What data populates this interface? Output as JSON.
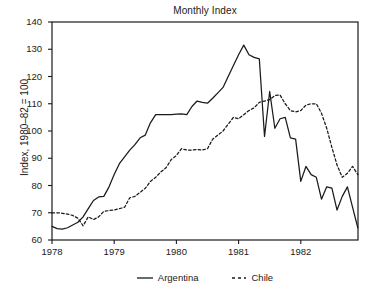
{
  "chart_data": {
    "type": "line",
    "title": "Monthly Index",
    "xlabel": "",
    "ylabel": "Index, 1980–82 = 100",
    "xlim": [
      1978.0,
      1982.92
    ],
    "ylim": [
      60,
      140
    ],
    "ytick_labels": [
      "140",
      "130",
      "120",
      "110",
      "100",
      "90",
      "80",
      "70",
      "60"
    ],
    "yticks": [
      140,
      130,
      120,
      110,
      100,
      90,
      80,
      70,
      60
    ],
    "xtick_labels": [
      "1978",
      "1979",
      "1980",
      "1981",
      "1982"
    ],
    "xticks": [
      1978,
      1979,
      1980,
      1981,
      1982
    ],
    "grid": false,
    "legend_position": "bottom",
    "series": [
      {
        "name": "Argentina",
        "style": "solid",
        "color": "#1a1a1a",
        "x": [
          1978.0,
          1978.083,
          1978.167,
          1978.25,
          1978.333,
          1978.417,
          1978.5,
          1978.583,
          1978.667,
          1978.75,
          1978.833,
          1978.917,
          1979.0,
          1979.083,
          1979.167,
          1979.25,
          1979.333,
          1979.417,
          1979.5,
          1979.583,
          1979.667,
          1979.75,
          1979.833,
          1979.917,
          1980.0,
          1980.083,
          1980.167,
          1980.25,
          1980.333,
          1980.417,
          1980.5,
          1980.583,
          1980.667,
          1980.75,
          1980.833,
          1980.917,
          1981.0,
          1981.083,
          1981.167,
          1981.25,
          1981.333,
          1981.417,
          1981.5,
          1981.583,
          1981.667,
          1981.75,
          1981.833,
          1981.917,
          1982.0,
          1982.083,
          1982.167,
          1982.25,
          1982.333,
          1982.417,
          1982.5,
          1982.583,
          1982.667,
          1982.75,
          1982.833,
          1982.917
        ],
        "values": [
          65.0,
          64.2,
          64.0,
          64.5,
          65.5,
          66.5,
          68.5,
          71.5,
          74.5,
          75.8,
          76.0,
          79.5,
          84.0,
          88.0,
          90.5,
          93.0,
          95.0,
          97.5,
          98.5,
          103.0,
          106.0,
          106.0,
          106.0,
          106.0,
          106.2,
          106.3,
          106.0,
          109.0,
          111.0,
          110.5,
          110.2,
          112.0,
          114.0,
          116.0,
          120.0,
          124.0,
          128.0,
          131.5,
          128.0,
          127.0,
          126.5,
          98.0,
          114.5,
          101.0,
          104.5,
          105.0,
          97.5,
          97.0,
          81.5,
          87.0,
          84.0,
          83.0,
          75.0,
          79.5,
          79.0,
          71.0,
          76.0,
          79.5,
          72.0,
          64.5
        ]
      },
      {
        "name": "Chile",
        "style": "dashed",
        "color": "#1a1a1a",
        "x": [
          1978.0,
          1978.083,
          1978.167,
          1978.25,
          1978.333,
          1978.417,
          1978.5,
          1978.583,
          1978.667,
          1978.75,
          1978.833,
          1978.917,
          1979.0,
          1979.083,
          1979.167,
          1979.25,
          1979.333,
          1979.417,
          1979.5,
          1979.583,
          1979.667,
          1979.75,
          1979.833,
          1979.917,
          1980.0,
          1980.083,
          1980.167,
          1980.25,
          1980.333,
          1980.417,
          1980.5,
          1980.583,
          1980.667,
          1980.75,
          1980.833,
          1980.917,
          1981.0,
          1981.083,
          1981.167,
          1981.25,
          1981.333,
          1981.417,
          1981.5,
          1981.583,
          1981.667,
          1981.75,
          1981.833,
          1981.917,
          1982.0,
          1982.083,
          1982.167,
          1982.25,
          1982.333,
          1982.417,
          1982.5,
          1982.583,
          1982.667,
          1982.75,
          1982.833,
          1982.917
        ],
        "values": [
          70.0,
          70.0,
          69.8,
          69.5,
          69.0,
          68.0,
          65.2,
          68.5,
          67.5,
          68.5,
          70.5,
          70.8,
          71.0,
          71.5,
          72.0,
          75.5,
          76.0,
          77.5,
          79.0,
          81.5,
          83.0,
          85.0,
          86.5,
          89.5,
          91.0,
          93.5,
          93.0,
          93.0,
          93.2,
          93.0,
          93.5,
          97.0,
          98.5,
          100.0,
          102.5,
          105.0,
          104.5,
          106.0,
          107.5,
          108.5,
          110.5,
          111.0,
          111.5,
          113.0,
          113.2,
          110.0,
          107.5,
          107.0,
          107.5,
          109.5,
          110.0,
          110.0,
          106.5,
          101.0,
          94.0,
          87.5,
          83.0,
          84.5,
          87.0,
          84.0
        ]
      }
    ]
  }
}
